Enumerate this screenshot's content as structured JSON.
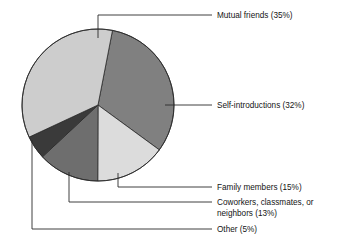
{
  "chart_data": {
    "type": "pie",
    "title": "",
    "subtitle": "",
    "xlabel": "",
    "ylabel": "",
    "legend_position": "callout-labels",
    "grid": false,
    "units": "percent",
    "total": 100,
    "start_angle_deg": -78,
    "direction": "clockwise",
    "categories": [
      "Self-introductions",
      "Family members",
      "Coworkers, classmates, or neighbors",
      "Other",
      "Mutual friends"
    ],
    "values": [
      32,
      15,
      13,
      5,
      35
    ],
    "labels": [
      "Self-introductions (32%)",
      "Family members (15%)",
      "Coworkers, classmates, or neighbors (13%)",
      "Other (5%)",
      "Mutual friends (35%)"
    ],
    "colors": [
      "#808080",
      "#dcdcdc",
      "#6e6e6e",
      "#3a3a3a",
      "#cdcdcd"
    ],
    "slices": [
      {
        "name": "mutual-friends",
        "label": "Mutual friends (35%)",
        "label_line1": "Mutual friends (35%)",
        "value": 35,
        "color": "#cdcdcd"
      },
      {
        "name": "self-introductions",
        "label": "Self-introductions (32%)",
        "label_line1": "Self-introductions (32%)",
        "value": 32,
        "color": "#808080"
      },
      {
        "name": "family-members",
        "label": "Family members (15%)",
        "label_line1": "Family members (15%)",
        "value": 15,
        "color": "#dcdcdc"
      },
      {
        "name": "coworkers-classmates-neighbors",
        "label": "Coworkers, classmates, or neighbors (13%)",
        "label_line1": "Coworkers, classmates, or",
        "label_line2": "neighbors (13%)",
        "value": 13,
        "color": "#6e6e6e"
      },
      {
        "name": "other",
        "label": "Other (5%)",
        "label_line1": "Other (5%)",
        "value": 5,
        "color": "#3a3a3a"
      }
    ]
  },
  "figure": {
    "background_color": "#ffffff",
    "outline_color": "#2b2b2b",
    "text_color": "#141414"
  }
}
